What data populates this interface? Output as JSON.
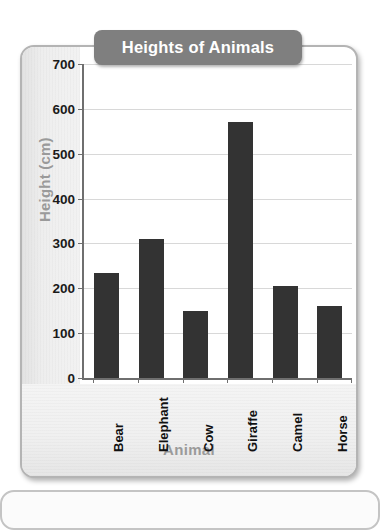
{
  "card": {
    "title": "Heights of Animals"
  },
  "chart_data": {
    "type": "bar",
    "title": "Heights of Animals",
    "categories": [
      "Bear",
      "Elephant",
      "Cow",
      "Giraffe",
      "Camel",
      "Horse"
    ],
    "values": [
      235,
      310,
      150,
      570,
      205,
      160
    ],
    "xlabel": "Animal",
    "ylabel": "Height (cm)",
    "ylim": [
      0,
      700
    ],
    "ytick_step": 100,
    "yticks": [
      700,
      600,
      500,
      400,
      300,
      200,
      100,
      0
    ],
    "ytick_labels": [
      "700",
      "600",
      "500",
      "400",
      "300",
      "200",
      "100",
      "0"
    ],
    "grid": true,
    "legend": false,
    "bar_color": "#333333",
    "plot_background": "#ffffff",
    "gridline_color": "#d8d8d8",
    "axis_color": "#6f6f6f",
    "axis_title_color": "#9a9a9a",
    "title_banner_color": "#7f7f7f",
    "title_text_color": "#ffffff"
  }
}
